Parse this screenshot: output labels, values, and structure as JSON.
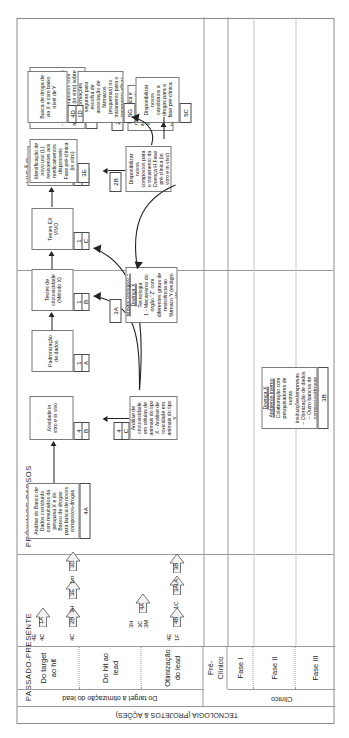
{
  "diagram": {
    "title_axis": "TECNOLOGIA (PROJETOS & AÇÕES)",
    "timeline": [
      {
        "id": "past",
        "label": "PASSADO-PRESENTE"
      },
      {
        "id": "next",
        "label": "PRÓXIMOS PASSOS"
      },
      {
        "id": "vision",
        "label": "VISÃO"
      }
    ],
    "group_labels": [
      {
        "id": "lead-opt",
        "label": "Do target à otimização do lead"
      },
      {
        "id": "clinic",
        "label": "Clínico"
      }
    ],
    "rows": [
      {
        "id": "target-hit",
        "label": "Do target\nao hit"
      },
      {
        "id": "hit-lead",
        "label": "Do hit ao\nlead"
      },
      {
        "id": "lead-opt-row",
        "label": "Otimização\ndo lead"
      },
      {
        "id": "pre-clinico",
        "label": "Pré-\nClínico"
      },
      {
        "id": "fase-1",
        "label": "Fase I"
      },
      {
        "id": "fase-2",
        "label": "Fase II"
      },
      {
        "id": "fase-3",
        "label": "Fase III"
      }
    ],
    "milestones": [
      {
        "id": "m1",
        "left": "4E",
        "left2": "4C",
        "right": "1A"
      },
      {
        "id": "m2",
        "left": "4C",
        "left2": "",
        "right": "2B"
      },
      {
        "id": "m3",
        "left": "3H",
        "left2": "",
        "right": "3E"
      },
      {
        "id": "m4",
        "left": "1m",
        "left2": "",
        "right": "3D"
      },
      {
        "id": "m5",
        "left": "3H",
        "left2": "3C\n3M",
        "right": "4A"
      },
      {
        "id": "m6",
        "left": "4E",
        "left2": "1F",
        "right": "4B"
      },
      {
        "id": "m7",
        "left": "1C",
        "left2": "",
        "right": "3A"
      },
      {
        "id": "m8",
        "left": "1A",
        "left2": "",
        "right": "3B"
      }
    ],
    "boxes": [
      {
        "id": "4A",
        "tag": "4A",
        "text": "Análise do Banco de Dados construído com resultados da pesquisa X e do Banco de drogas para busca de novos compostos-drogas"
      },
      {
        "id": "4B",
        "tag_top": "4",
        "tag_bottom": "B",
        "text": "Atividade in vitro e in vivo"
      },
      {
        "id": "4C",
        "tag_top": "4",
        "tag_bottom": "C",
        "text": "Análise de citotoxicidade em células de animais do tipo X - Análise de toxicidade em animais do tipo Y"
      },
      {
        "id": "1A",
        "tag_top": "1",
        "tag_bottom": "A",
        "text": "Padronização de dados"
      },
      {
        "id": "1B",
        "tag_top": "1",
        "tag_bottom": "B",
        "text": "Testes de citotoxicidade (Método X)"
      },
      {
        "id": "1C",
        "tag_top": "1",
        "tag_bottom": "C",
        "text": "Testes EX VIVO"
      },
      {
        "id": "2A",
        "tag_top": "2",
        "tag_bottom": "A",
        "text": "Indicações de associações eficazes dos fármacos X, Y, Z, W e T Fase pré-clínica (in vivo)"
      },
      {
        "id": "2B",
        "tag": "2B",
        "text": "Disponibilizar novos compostos para o tratamento da Doença H Fase pré-clínica (in vitro e in vivo)"
      },
      {
        "id": "2D",
        "tag": "2D",
        "text": "- Avaliação toxicológica e mecanismo de ação das novas alternativas de tratamento e novas substâncias potenciais Fase pré-clínica"
      },
      {
        "id": "3A",
        "tag": "3A",
        "title": "Ensaio Biológico – Doença X",
        "text": "Tecnologia\n1 - Mecanismo do órgão \"Z\" com diferentes graus de resistência ao fármaco Y (estágio W)"
      },
      {
        "id": "3B",
        "tag": "3B",
        "title": "Ensaio Biológico – Doença X\nAmbiente interno",
        "text": "Colaboração com pesquisadores de outras instituições/empresas\n– Otimização de dados\n– Outro bancos de compostos/drogas\n– Testes Fases I, II e III"
      },
      {
        "id": "3C",
        "tag": "3C",
        "title": "Ensaio Biológico – Doença X",
        "text": "- Automatização do ensaio?\n- Identificação de um ou mais compostos com atividade (in vitro) sobre orgão de J"
      },
      {
        "id": "3E",
        "tag": "3E",
        "text": "Identificação de novo uso (L) resistentes aos medicamentos disponíveis Fase pré-clínica (in vitro)"
      },
      {
        "id": "5C",
        "tag": "5C",
        "text": "Disponibilizar novos candidatos a drogas para a fase pré-clínica"
      },
      {
        "id": "5G",
        "tag": "5G",
        "text": "Disponibilizar informações seguras para escolha de associação de fármacos (esquemas) no tratamento para o tratamento eficaz da doença Y"
      },
      {
        "id": "4D1D",
        "tag_top": "4D",
        "tag_bottom": "1D",
        "text": "Busca de droga de via X e com baixo nível de Y"
      }
    ]
  }
}
